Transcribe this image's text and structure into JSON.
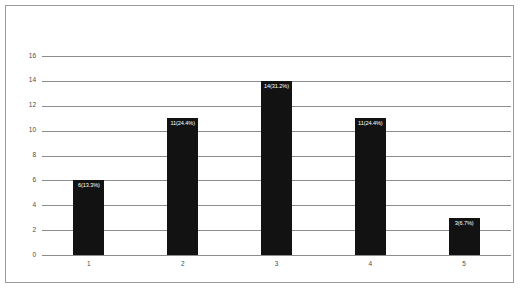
{
  "chart_data": {
    "type": "bar",
    "title": "",
    "subtitle": "",
    "xlabel": "",
    "ylabel": "",
    "categories": [
      "1",
      "2",
      "3",
      "4",
      "5"
    ],
    "values": [
      6,
      11,
      14,
      11,
      3
    ],
    "data_labels": [
      "6(13.3%)",
      "11(24.4%)",
      "14(31.2%)",
      "11(24.4%)",
      "3(6.7%)"
    ],
    "percentages": [
      13.3,
      24.4,
      31.2,
      24.4,
      6.7
    ],
    "ylim": [
      0,
      16
    ],
    "ytick_values": [
      0,
      2,
      4,
      6,
      8,
      10,
      12,
      14,
      16
    ],
    "ytick_labels": [
      "0",
      "2",
      "4",
      "6",
      "8",
      "10",
      "12",
      "14",
      "16"
    ],
    "grid": "horizontal",
    "legend": "none",
    "bar_color": "#121212",
    "grid_color": "#8d8d8d",
    "tick_label_color": "#4a4a4a",
    "data_label_color": "#ffffff",
    "frame_color": "#9a9a9a",
    "background_color": "#ffffff"
  }
}
